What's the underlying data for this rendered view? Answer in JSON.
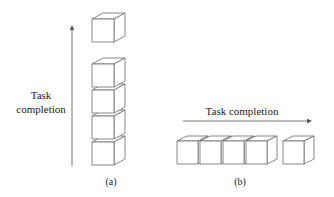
{
  "panel_a": {
    "axis_label_line1": "Task",
    "axis_label_line2": "completion",
    "caption": "(a)",
    "arrow_direction": "up",
    "stacked_cubes": 4,
    "separated_cubes": 1
  },
  "panel_b": {
    "axis_label": "Task completion",
    "caption": "(b)",
    "arrow_direction": "right",
    "adjacent_cubes": 4,
    "separated_cubes": 1
  }
}
